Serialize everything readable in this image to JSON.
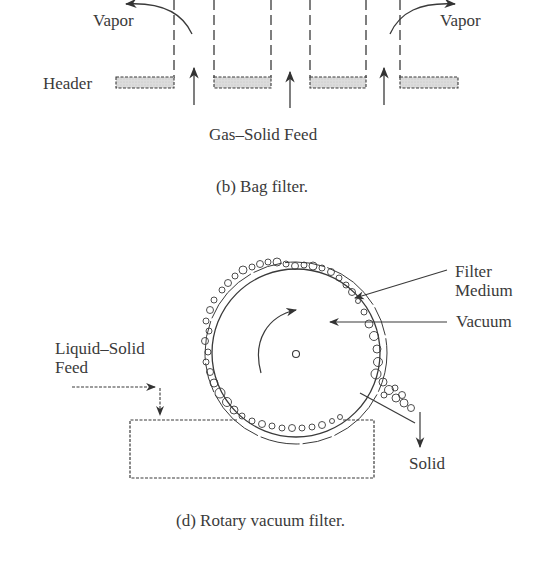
{
  "bag_filter": {
    "labels": {
      "vapor_left": "Vapor",
      "vapor_right": "Vapor",
      "header": "Header",
      "feed": "Gas–Solid Feed"
    },
    "caption": "(b) Bag filter."
  },
  "rotary_vacuum_filter": {
    "labels": {
      "filter_medium_line1": "Filter",
      "filter_medium_line2": "Medium",
      "vacuum": "Vacuum",
      "feed_line1": "Liquid–Solid",
      "feed_line2": "Feed",
      "solid": "Solid"
    },
    "caption": "(d) Rotary vacuum filter."
  },
  "colors": {
    "line": "#3a3a3a",
    "header_fill": "#d9d9d9",
    "background": "#ffffff"
  }
}
